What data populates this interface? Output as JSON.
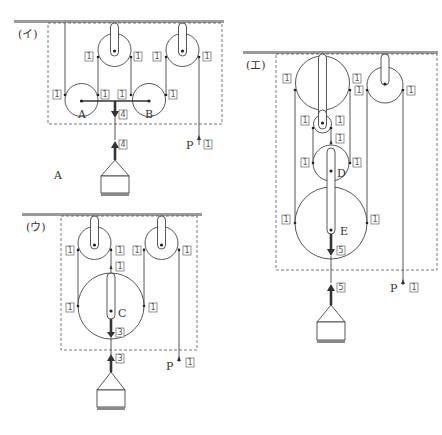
{
  "diagrams": {
    "i": {
      "title": "(イ)",
      "pulley_labels": [
        "A",
        "B"
      ],
      "tensions": {
        "rope": "1",
        "bar_down": "4",
        "load_up": "4",
        "pull": "1"
      },
      "pull_label": "P"
    },
    "u": {
      "title": "(ウ)",
      "pulley_labels": [
        "C"
      ],
      "tensions": {
        "rope": "1",
        "axle_up": "1",
        "bar_down": "3",
        "load_up": "3",
        "pull": "1"
      },
      "pull_label": "P"
    },
    "e": {
      "title": "(エ)",
      "pulley_labels": [
        "D",
        "E"
      ],
      "tensions": {
        "rope": "1",
        "axle_up": "1",
        "bar_down": "5",
        "load_up": "5",
        "pull": "1"
      },
      "pull_label": "P"
    }
  },
  "stray_label": "A",
  "colors": {
    "ceiling": "#9a9a9a",
    "line": "#444444",
    "weight_base": "#888888"
  }
}
